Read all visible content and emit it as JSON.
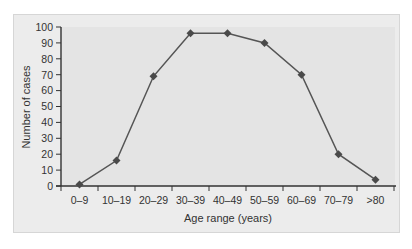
{
  "chart_data": {
    "type": "line",
    "title": "",
    "xlabel": "Age range (years)",
    "ylabel": "Number of cases",
    "categories": [
      "0–9",
      "10–19",
      "20–29",
      "30–39",
      "40–49",
      "50–59",
      "60–69",
      "70–79",
      ">80"
    ],
    "series": [
      {
        "name": "Number of cases",
        "values": [
          1,
          16,
          69,
          96,
          96,
          90,
          70,
          20,
          4
        ],
        "color": "#555555",
        "marker": "diamond"
      }
    ],
    "ylim": [
      0,
      100
    ],
    "yticks": [
      0,
      10,
      20,
      30,
      40,
      50,
      60,
      70,
      80,
      90,
      100
    ],
    "grid": false,
    "legend": null
  },
  "colors": {
    "panel_bg": "#ececec",
    "plot_bg": "#e4e4e4",
    "line": "#555555",
    "axis": "#333333"
  }
}
